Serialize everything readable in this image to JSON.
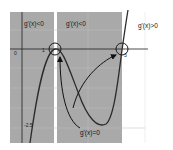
{
  "diagram": {
    "type": "function-graph",
    "region_labels": [
      "g'(x)<0",
      "g'(x)<0",
      "g'(x)>0"
    ],
    "annotation": "g'(x)=0",
    "tick_labels": {
      "origin": "0",
      "x_one": "1",
      "x_three": "3",
      "y_neg": "-2.5"
    },
    "critical_points_x": [
      1,
      3
    ],
    "colors": {
      "shaded": "#a9a9a9",
      "curve": "#2b2b2b",
      "axis": "#1e1e1e",
      "grid": "#bdbdbd",
      "background": "#ffffff"
    }
  }
}
